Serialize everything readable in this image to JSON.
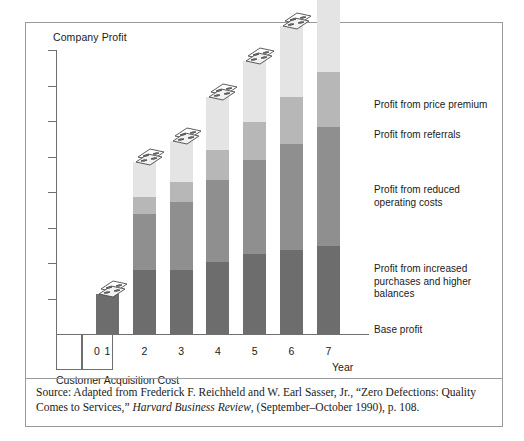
{
  "figure": {
    "y_axis_title": "Company Profit",
    "x_axis_title": "Year",
    "cac_caption": "Customer Acquisition Cost",
    "source_prefix": "Source: Adapted from Frederick F. Reichheld and W. Earl Sasser, Jr., “Zero Defections: Quality Comes to Services,” ",
    "source_italic": "Harvard Business Review",
    "source_suffix": ", (September–October 1990), p. 108."
  },
  "chart_data": {
    "type": "bar",
    "title": "Company Profit",
    "xlabel": "Year",
    "ylabel": "Company Profit",
    "stacked": true,
    "grid": false,
    "legend_position": "right",
    "axis_ticks_count": 8,
    "categories": [
      "0",
      "1",
      "2",
      "3",
      "4",
      "5",
      "6",
      "7"
    ],
    "series": [
      {
        "name": "Base profit",
        "color": "#6d6d6d",
        "values": [
          0,
          40,
          64,
          64,
          72,
          80,
          84,
          88
        ]
      },
      {
        "name": "Profit from increased purchases and higher balances",
        "color": "#8f8f8f",
        "values": [
          0,
          0,
          56,
          68,
          82,
          94,
          106,
          119
        ]
      },
      {
        "name": "Profit from reduced operating costs",
        "color": "#b7b7b7",
        "values": [
          0,
          0,
          17,
          20,
          30,
          38,
          47,
          55
        ]
      },
      {
        "name": "Profit from referrals",
        "color": "#d4d4d4",
        "values": [
          0,
          0,
          0,
          0,
          0,
          0,
          0,
          0
        ]
      },
      {
        "name": "Profit from price premium",
        "color": "#e4e4e4",
        "values": [
          0,
          0,
          35,
          41,
          53,
          61,
          71,
          83
        ]
      }
    ],
    "legend_entries": [
      "Profit from price premium",
      "Profit from referrals",
      "Profit from reduced\noperating costs",
      "Profit from increased\npurchases and higher balances",
      "Base profit"
    ],
    "cac_note": "Customer Acquisition Cost"
  },
  "bars": [
    {
      "label": "1",
      "segments": [
        {
          "h": 40,
          "color": "#6d6d6d"
        }
      ]
    },
    {
      "label": "2",
      "segments": [
        {
          "h": 64,
          "color": "#6d6d6d"
        },
        {
          "h": 56,
          "color": "#8f8f8f"
        },
        {
          "h": 17,
          "color": "#b7b7b7"
        },
        {
          "h": 35,
          "color": "#e4e4e4"
        }
      ]
    },
    {
      "label": "3",
      "segments": [
        {
          "h": 64,
          "color": "#6d6d6d"
        },
        {
          "h": 68,
          "color": "#8f8f8f"
        },
        {
          "h": 20,
          "color": "#b7b7b7"
        },
        {
          "h": 41,
          "color": "#e4e4e4"
        }
      ]
    },
    {
      "label": "4",
      "segments": [
        {
          "h": 72,
          "color": "#6d6d6d"
        },
        {
          "h": 82,
          "color": "#8f8f8f"
        },
        {
          "h": 30,
          "color": "#b7b7b7"
        },
        {
          "h": 53,
          "color": "#e4e4e4"
        }
      ]
    },
    {
      "label": "5",
      "segments": [
        {
          "h": 80,
          "color": "#6d6d6d"
        },
        {
          "h": 94,
          "color": "#8f8f8f"
        },
        {
          "h": 38,
          "color": "#b7b7b7"
        },
        {
          "h": 61,
          "color": "#e4e4e4"
        }
      ]
    },
    {
      "label": "6",
      "segments": [
        {
          "h": 84,
          "color": "#6d6d6d"
        },
        {
          "h": 106,
          "color": "#8f8f8f"
        },
        {
          "h": 47,
          "color": "#b7b7b7"
        },
        {
          "h": 71,
          "color": "#e4e4e4"
        }
      ]
    },
    {
      "label": "7",
      "segments": [
        {
          "h": 88,
          "color": "#6d6d6d"
        },
        {
          "h": 119,
          "color": "#8f8f8f"
        },
        {
          "h": 55,
          "color": "#b7b7b7"
        },
        {
          "h": 83,
          "color": "#e4e4e4"
        }
      ]
    }
  ],
  "x_labels": [
    "0",
    "1",
    "2",
    "3",
    "4",
    "5",
    "6",
    "7"
  ],
  "legend": [
    {
      "text": "Profit from price premium",
      "top": 76
    },
    {
      "text": "Profit from referrals",
      "top": 106
    },
    {
      "text": "Profit from reduced\noperating costs",
      "top": 161
    },
    {
      "text": "Profit from increased\npurchases and higher balances",
      "top": 240
    },
    {
      "text": "Base profit",
      "top": 301
    }
  ],
  "colors": {
    "base_profit": "#6d6d6d",
    "increased_purchases": "#8f8f8f",
    "reduced_operating_costs": "#b7b7b7",
    "referrals": "#d4d4d4",
    "price_premium": "#e4e4e4",
    "axis": "#6f6f6f",
    "border": "#9a9a9a"
  }
}
